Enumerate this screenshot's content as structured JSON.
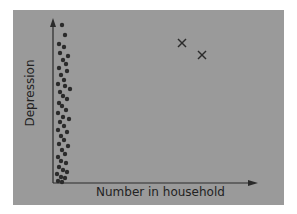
{
  "chart_data": {
    "type": "scatter",
    "title": "",
    "xlabel": "Number in household",
    "ylabel": "Depression",
    "grid": false,
    "legend": null,
    "axis_ticks": "none",
    "series": [
      {
        "name": "main cluster",
        "marker": "dot",
        "description": "Dense vertical cluster of dots near x=0 spanning the full depression range",
        "points_px": [
          [
            62,
            25
          ],
          [
            65,
            35
          ],
          [
            59,
            44
          ],
          [
            64,
            47
          ],
          [
            60,
            53
          ],
          [
            68,
            56
          ],
          [
            63,
            60
          ],
          [
            66,
            64
          ],
          [
            59,
            68
          ],
          [
            67,
            71
          ],
          [
            61,
            75
          ],
          [
            64,
            80
          ],
          [
            58,
            84
          ],
          [
            65,
            86
          ],
          [
            70,
            89
          ],
          [
            60,
            92
          ],
          [
            63,
            96
          ],
          [
            67,
            99
          ],
          [
            59,
            103
          ],
          [
            62,
            106
          ],
          [
            66,
            110
          ],
          [
            58,
            113
          ],
          [
            63,
            117
          ],
          [
            69,
            119
          ],
          [
            60,
            122
          ],
          [
            64,
            126
          ],
          [
            58,
            130
          ],
          [
            67,
            132
          ],
          [
            61,
            136
          ],
          [
            64,
            140
          ],
          [
            59,
            144
          ],
          [
            68,
            146
          ],
          [
            62,
            150
          ],
          [
            65,
            154
          ],
          [
            58,
            157
          ],
          [
            61,
            161
          ],
          [
            66,
            163
          ],
          [
            59,
            167
          ],
          [
            63,
            170
          ],
          [
            67,
            172
          ],
          [
            57,
            174
          ],
          [
            61,
            177
          ],
          [
            65,
            178
          ],
          [
            58,
            181
          ],
          [
            62,
            182
          ]
        ]
      },
      {
        "name": "outliers",
        "marker": "x",
        "points_px": [
          [
            182,
            43
          ],
          [
            202,
            55
          ]
        ]
      }
    ]
  },
  "axes": {
    "y_label": "Depression",
    "x_label": "Number in household"
  }
}
